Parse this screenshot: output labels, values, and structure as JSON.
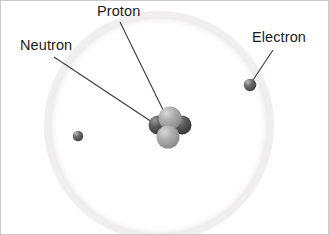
{
  "figure": {
    "name": "atom-structure-diagram",
    "background_color": "#ffffff",
    "border_color": "#c9c9c9",
    "width": 329,
    "height": 235
  },
  "labels": {
    "proton": "Proton",
    "neutron": "Neutron",
    "electron": "Electron"
  },
  "colors": {
    "text": "#1b1b1b",
    "leader_line": "#3a3a3a",
    "orbit": "#f1f1f1",
    "proton_sphere": "#9a9a9a",
    "proton_sphere_highlight": "#cfcfcf",
    "neutron_sphere": "#4a4a4a",
    "neutron_sphere_highlight": "#8a8a8a",
    "electron_sphere": "#555555",
    "electron_sphere_highlight": "#b5b5b5"
  },
  "orbit": {
    "center_x": 158,
    "center_y": 125,
    "radius": 112,
    "stroke_width": 7
  },
  "nucleus": {
    "center_x": 168,
    "center_y": 128,
    "particles": [
      {
        "type": "neutron",
        "cx": 157,
        "cy": 124,
        "r": 9
      },
      {
        "type": "neutron",
        "cx": 180,
        "cy": 124,
        "r": 9
      },
      {
        "type": "proton",
        "cx": 169,
        "cy": 118,
        "r": 11
      },
      {
        "type": "proton",
        "cx": 168,
        "cy": 136,
        "r": 11
      }
    ]
  },
  "electrons": [
    {
      "cx": 249,
      "cy": 84,
      "r": 6
    },
    {
      "cx": 77,
      "cy": 135,
      "r": 5
    }
  ],
  "leader_lines": [
    {
      "for": "proton",
      "x1": 119,
      "y1": 21,
      "x2": 168,
      "y2": 121
    },
    {
      "for": "neutron",
      "x1": 53,
      "y1": 56,
      "x2": 160,
      "y2": 127
    },
    {
      "for": "electron",
      "x1": 272,
      "y1": 49,
      "x2": 250,
      "y2": 82
    }
  ]
}
